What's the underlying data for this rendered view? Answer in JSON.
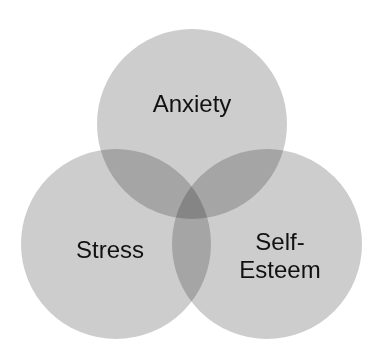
{
  "diagram": {
    "type": "venn",
    "circles": [
      {
        "id": "anxiety",
        "label": "Anxiety",
        "cx": 192,
        "cy": 124,
        "r": 96
      },
      {
        "id": "stress",
        "label": "Stress",
        "cx": 116,
        "cy": 244,
        "r": 96
      },
      {
        "id": "self-esteem",
        "label": "Self-\nEsteem",
        "cx": 267,
        "cy": 244,
        "r": 96
      }
    ],
    "colors": {
      "fill": "#c4c4c4",
      "overlap_opacity": 0.55,
      "stroke": "#ffffff",
      "text": "#111111"
    }
  }
}
